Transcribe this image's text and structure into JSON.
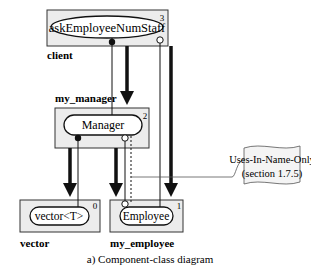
{
  "diagram": {
    "caption": "a) Component-class diagram",
    "colors": {
      "box_fill": "#ececec",
      "stroke": "#1a1a1a",
      "background": "#ffffff"
    },
    "components": [
      {
        "id": "client",
        "name": "client",
        "level": "3",
        "class": "askEmployeeNumStaff",
        "class_shape": "ellipse"
      },
      {
        "id": "my_manager",
        "name": "my_manager",
        "level": "2",
        "class": "Manager",
        "class_shape": "pill"
      },
      {
        "id": "vector",
        "name": "vector",
        "level": "0",
        "class": "vector<T>",
        "class_shape": "pill"
      },
      {
        "id": "my_employee",
        "name": "my_employee",
        "level": "1",
        "class": "Employee",
        "class_shape": "pill"
      }
    ],
    "note": {
      "line1": "Uses-In-Name-Only",
      "line2": "(section 1.7.5)"
    },
    "relations": [
      {
        "from": "client",
        "to": "my_manager",
        "type": "depends-on (thick arrow)"
      },
      {
        "from": "client",
        "to": "my_employee",
        "type": "depends-on (thick arrow)"
      },
      {
        "from": "askEmployeeNumStaff",
        "to": "Manager",
        "type": "uses-in-interface (filled dot)"
      },
      {
        "from": "askEmployeeNumStaff",
        "to": "Employee",
        "type": "uses-in-name-only (open circle)"
      },
      {
        "from": "my_manager",
        "to": "vector",
        "type": "depends-on (thick arrow)"
      },
      {
        "from": "my_manager",
        "to": "my_employee",
        "type": "depends-on (thick arrow)"
      },
      {
        "from": "Manager",
        "to": "vector<T>",
        "type": "uses-in-interface (filled dot)"
      },
      {
        "from": "Manager",
        "to": "Employee",
        "type": "uses-in-name-only (open circle)"
      }
    ]
  }
}
